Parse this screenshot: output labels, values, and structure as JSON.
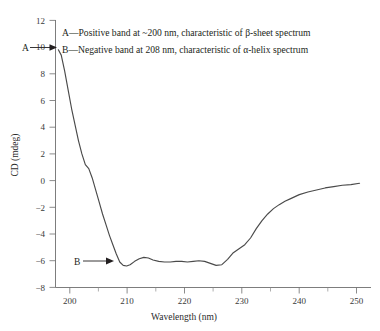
{
  "chart_data": {
    "type": "line",
    "title": "",
    "xlabel": "Wavelength (nm)",
    "ylabel": "CD (mdeg)",
    "xlim": [
      197,
      252
    ],
    "ylim": [
      -8,
      12
    ],
    "xticks": [
      200,
      210,
      220,
      230,
      240,
      250
    ],
    "xtick_labels": [
      "200",
      "210",
      "220",
      "230",
      "240",
      "250"
    ],
    "xticks_minor": [
      205,
      215,
      225,
      235,
      245
    ],
    "yticks": [
      -8,
      -6,
      -4,
      -2,
      0,
      2,
      4,
      6,
      8,
      10,
      12
    ],
    "ytick_labels": [
      "−8",
      "−6",
      "−4",
      "−2",
      "0",
      "2",
      "4",
      "6",
      "8",
      "10",
      "12"
    ],
    "grid": false,
    "legend": "none",
    "series": [
      {
        "name": "CD spectrum",
        "color": "#4a4a4a",
        "x": [
          197.5,
          198.0,
          198.6,
          199.2,
          199.8,
          200.4,
          201.0,
          201.6,
          202.2,
          202.8,
          203.4,
          204.0,
          204.6,
          205.2,
          205.8,
          206.4,
          207.0,
          207.6,
          208.2,
          208.8,
          209.4,
          210.0,
          210.8,
          211.6,
          212.4,
          213.2,
          214.0,
          215.0,
          216.0,
          217.0,
          218.0,
          219.0,
          220.0,
          221.0,
          222.0,
          223.0,
          224.0,
          225.0,
          226.0,
          227.0,
          228.0,
          229.0,
          230.0,
          231.0,
          232.0,
          233.0,
          234.0,
          235.0,
          236.0,
          237.0,
          238.0,
          239.5,
          241.0,
          242.5,
          244.0,
          245.5,
          247.0,
          248.5,
          250.0
        ],
        "y": [
          9.8,
          9.4,
          8.2,
          6.8,
          5.4,
          4.2,
          3.0,
          2.0,
          1.2,
          0.9,
          0.2,
          -0.7,
          -1.6,
          -2.5,
          -3.3,
          -4.1,
          -4.8,
          -5.5,
          -6.1,
          -6.35,
          -6.4,
          -6.3,
          -6.05,
          -5.85,
          -5.75,
          -5.8,
          -5.95,
          -6.05,
          -6.1,
          -6.1,
          -6.05,
          -6.05,
          -6.1,
          -6.05,
          -6.0,
          -6.05,
          -6.2,
          -6.35,
          -6.3,
          -5.9,
          -5.4,
          -5.1,
          -4.8,
          -4.3,
          -3.6,
          -3.0,
          -2.5,
          -2.1,
          -1.8,
          -1.55,
          -1.35,
          -1.05,
          -0.85,
          -0.7,
          -0.55,
          -0.45,
          -0.35,
          -0.3,
          -0.2
        ]
      }
    ],
    "annotations": [
      {
        "name": "note-a",
        "text": "A—Positive band at ~200 nm, characteristic of β-sheet spectrum"
      },
      {
        "name": "note-b",
        "text": "B—Negative band at 208 nm, characteristic of α-helix spectrum"
      },
      {
        "name": "marker-a",
        "text": "A",
        "points_to": {
          "x": 197.8,
          "y": 9.9
        }
      },
      {
        "name": "marker-b",
        "text": "B",
        "points_to": {
          "x": 208.6,
          "y": -6.35
        }
      }
    ]
  }
}
